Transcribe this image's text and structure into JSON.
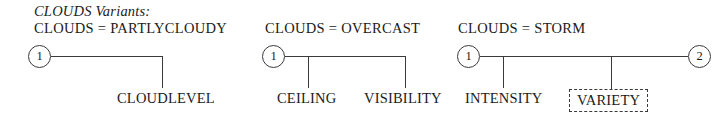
{
  "figure": {
    "title": "CLOUDS Variants:",
    "groups": [
      {
        "header_lhs": "CLOUDS",
        "header_op": "=",
        "header_rhs": "PARTLYCLOUDY",
        "start_state": "1",
        "end_state": null,
        "leaves": [
          {
            "label": "CLOUDLEVEL",
            "optional": false
          }
        ]
      },
      {
        "header_lhs": "CLOUDS",
        "header_op": "=",
        "header_rhs": "OVERCAST",
        "start_state": "1",
        "end_state": null,
        "leaves": [
          {
            "label": "CEILING",
            "optional": false
          },
          {
            "label": "VISIBILITY",
            "optional": false
          }
        ]
      },
      {
        "header_lhs": "CLOUDS",
        "header_op": "=",
        "header_rhs": "STORM",
        "start_state": "1",
        "end_state": "2",
        "leaves": [
          {
            "label": "INTENSITY",
            "optional": false
          },
          {
            "label": "VARIETY",
            "optional": true
          }
        ]
      }
    ]
  },
  "colors": {
    "ink": "#1b1b1b",
    "line": "#3a3a3a",
    "background": "#ffffff"
  }
}
